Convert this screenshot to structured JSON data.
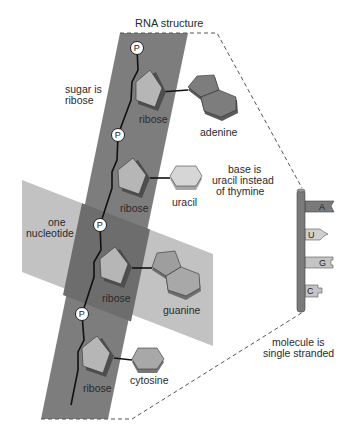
{
  "title": "RNA structure",
  "annotations": {
    "sugar": [
      "sugar is",
      "ribose"
    ],
    "nucleotide": [
      "one",
      "nucleotide"
    ],
    "base": [
      "base is",
      "uracil instead",
      "of thymine"
    ],
    "strand": [
      "molecule is",
      "single stranded"
    ]
  },
  "nucleotides": [
    {
      "sugar_label": "ribose",
      "base_label": "adenine",
      "base_shape": "double-ring",
      "base_color": "#7d7d7d"
    },
    {
      "sugar_label": "ribose",
      "base_label": "uracil",
      "base_shape": "single-ring",
      "base_color": "#d4d4d4"
    },
    {
      "sugar_label": "ribose",
      "base_label": "guanine",
      "base_shape": "double-ring",
      "base_color": "#9e9e9e"
    },
    {
      "sugar_label": "ribose",
      "base_label": "cytosine",
      "base_shape": "single-ring",
      "base_color": "#a8a8a8"
    }
  ],
  "phosphate_label": "P",
  "molecule_tabs": [
    {
      "letter": "A",
      "shape": "notch"
    },
    {
      "letter": "U",
      "shape": "arrow"
    },
    {
      "letter": "G",
      "shape": "bracket"
    },
    {
      "letter": "C",
      "shape": "bump"
    }
  ],
  "colors": {
    "backbone_band": "#7a7a7a",
    "nucleotide_plane": "#bdbdbd",
    "overlap": "#6b6b6b",
    "ribose_face": "#b4b4b4",
    "ribose_side": "#5e5e5e",
    "dashed_outline": "#555555",
    "rod": "#7a7a7a"
  }
}
